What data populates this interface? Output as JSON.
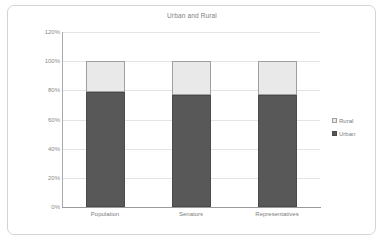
{
  "chart_data": {
    "type": "bar",
    "subtype": "stacked-column-100",
    "title": "Urban and Rural",
    "xlabel": "",
    "ylabel": "",
    "categories": [
      "Population",
      "Senators",
      "Representatives"
    ],
    "series": [
      {
        "name": "Urban",
        "values": [
          79,
          77,
          77
        ],
        "color": "#585858"
      },
      {
        "name": "Rural",
        "values": [
          21,
          23,
          23
        ],
        "color": "#e9e9e9"
      }
    ],
    "ylim": [
      0,
      120
    ],
    "ytick_values": [
      0,
      20,
      40,
      60,
      80,
      100,
      120
    ],
    "ytick_labels": [
      "0%",
      "20%",
      "40%",
      "60%",
      "80%",
      "100%",
      "120%"
    ],
    "grid": true,
    "legend_position": "right",
    "legend_entries": [
      "Rural",
      "Urban"
    ],
    "value_suffix": "%",
    "stack_total": 100
  },
  "colors": {
    "urban": "#585858",
    "urban_border": "#4a4a4a",
    "rural": "#e9e9e9",
    "rural_border": "#9f9f9f",
    "gridline": "#e4e4e4",
    "axis": "#9a9a9a",
    "text": "#7d7d7d",
    "frame": "#d4d4d4",
    "background": "#ffffff"
  }
}
